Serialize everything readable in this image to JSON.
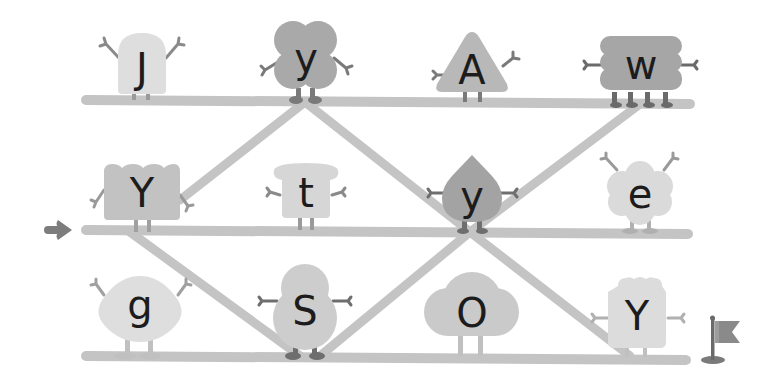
{
  "game": {
    "type": "letter-maze",
    "start_marker": "arrow-right",
    "goal_marker": "flag",
    "colors": {
      "background": "#ffffff",
      "rail": "#c4c4c4",
      "character_light": "#dedede",
      "character_mid": "#cfcfcf",
      "character_dark": "#a9a9a9",
      "limbs": "#7a7a7a",
      "letter": "#1c1c1c",
      "arrow": "#7d7d7d",
      "flag": "#8a8a8a"
    },
    "rows": [
      {
        "name": "top",
        "characters": [
          {
            "letter": "J",
            "shape": "tall-rounded"
          },
          {
            "letter": "y",
            "shape": "four-lobe"
          },
          {
            "letter": "A",
            "shape": "triangle"
          },
          {
            "letter": "w",
            "shape": "stacked-cloud"
          }
        ]
      },
      {
        "name": "middle",
        "characters": [
          {
            "letter": "Y",
            "shape": "scalloped-box"
          },
          {
            "letter": "t",
            "shape": "bread"
          },
          {
            "letter": "y",
            "shape": "drop"
          },
          {
            "letter": "e",
            "shape": "flower-cloud"
          }
        ]
      },
      {
        "name": "bottom",
        "characters": [
          {
            "letter": "g",
            "shape": "lemon"
          },
          {
            "letter": "S",
            "shape": "snowman"
          },
          {
            "letter": "O",
            "shape": "cloud"
          },
          {
            "letter": "Y",
            "shape": "jar"
          }
        ]
      }
    ]
  }
}
